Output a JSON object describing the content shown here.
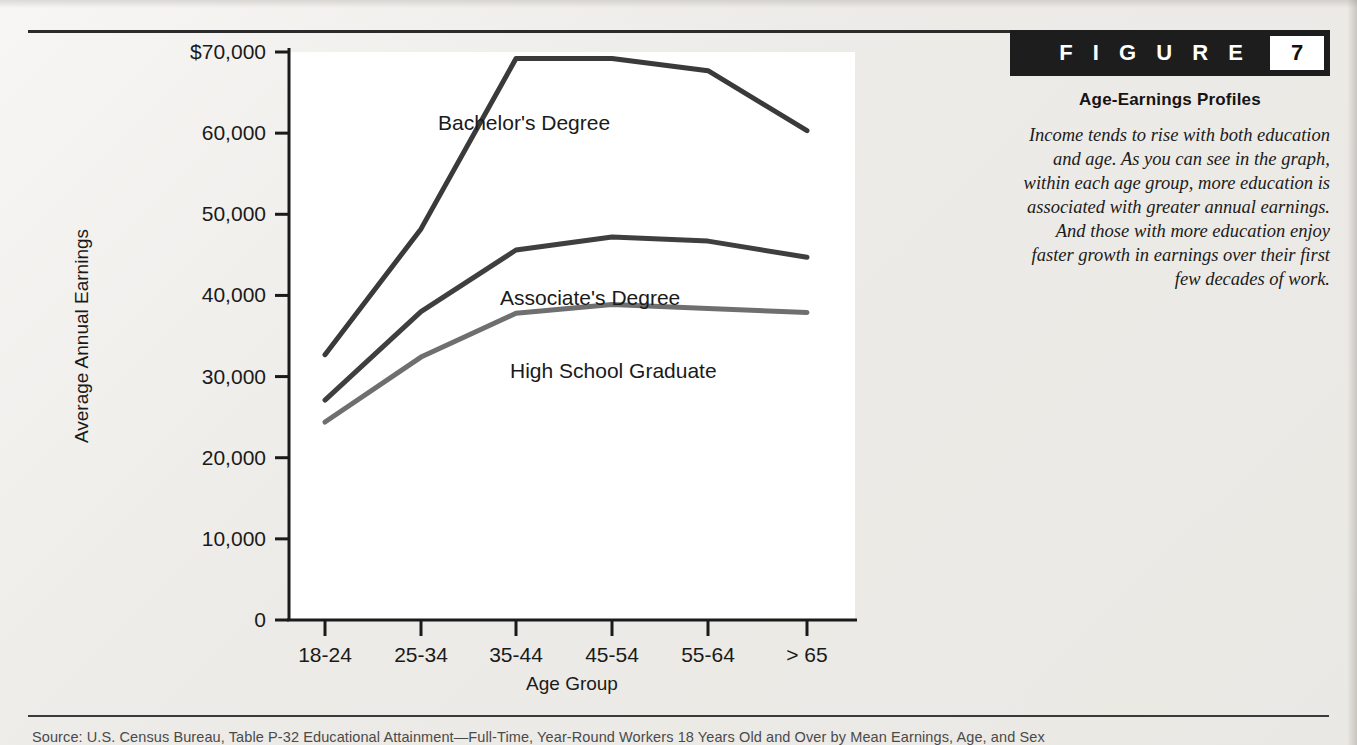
{
  "figure": {
    "banner_word": "F I G U R E",
    "number": "7",
    "title": "Age-Earnings Profiles",
    "caption": "Income tends to rise with both education and age. As you can see in the graph, within each age group, more education is associated with greater annual earnings. And those with more education enjoy faster growth in earnings over their first few decades of work."
  },
  "source": {
    "text": "Source:  U.S. Census Bureau, Table P-32 Educational Attainment—Full-Time, Year-Round Workers 18 Years Old and Over by Mean Earnings, Age, and Sex"
  },
  "colors": {
    "banner_bg": "#1d1d1d",
    "banner_fg": "#ffffff",
    "axis": "#1a1a1a",
    "bachelors_line": "#3a3a3a",
    "associates_line": "#3f3f3f",
    "highschool_line": "#6f6f6f",
    "page_bg": "#edebe7",
    "plot_bg": "#ffffff"
  },
  "chart_data": {
    "type": "line",
    "title": "Age-Earnings Profiles",
    "xlabel": "Age Group",
    "ylabel": "Average Annual Earnings",
    "categories": [
      "18-24",
      "25-34",
      "35-44",
      "45-54",
      "55-64",
      "> 65"
    ],
    "ylim": [
      0,
      70000
    ],
    "ytick_values": [
      0,
      10000,
      20000,
      30000,
      40000,
      50000,
      60000,
      70000
    ],
    "ytick_labels": [
      "0",
      "10,000",
      "20,000",
      "30,000",
      "40,000",
      "50,000",
      "60,000",
      "$70,000"
    ],
    "grid": false,
    "legend": "inline-labels",
    "series": [
      {
        "name": "Bachelor's Degree",
        "color": "#3a3a3a",
        "values": [
          32700,
          48200,
          69200,
          69200,
          67700,
          60300
        ]
      },
      {
        "name": "Associate's Degree",
        "color": "#3f3f3f",
        "values": [
          27100,
          38000,
          45600,
          47200,
          46700,
          44700
        ]
      },
      {
        "name": "High School Graduate",
        "color": "#6f6f6f",
        "values": [
          24400,
          32400,
          37800,
          38900,
          38400,
          37900
        ]
      }
    ],
    "annotations": [
      {
        "text": "Bachelor's Degree",
        "x_px": 438,
        "y_px": 100,
        "color": "#1a1a1a"
      },
      {
        "text": "Associate's Degree",
        "x_px": 500,
        "y_px": 275,
        "color": "#1a1a1a"
      },
      {
        "text": "High School Graduate",
        "x_px": 510,
        "y_px": 348,
        "color": "#555555"
      }
    ]
  }
}
